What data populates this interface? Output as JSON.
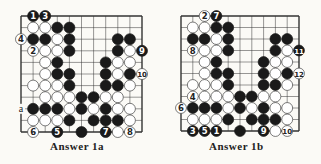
{
  "colors": {
    "black": "#1a1a1a",
    "white": "#ffffff",
    "line": "#333333",
    "paper": "#fbfaf6"
  },
  "boards": [
    {
      "caption": "Answer 1a",
      "origin": [
        21,
        16
      ],
      "step": [
        12.1,
        11.6
      ],
      "cols": 11,
      "rows": 11,
      "labels": [
        {
          "text": "a",
          "c": 0,
          "r": 8
        }
      ],
      "stones": [
        {
          "c": 1,
          "r": 0,
          "color": "B",
          "n": "1"
        },
        {
          "c": 2,
          "r": 0,
          "color": "B",
          "n": "3"
        },
        {
          "c": 1,
          "r": 1,
          "color": "W"
        },
        {
          "c": 2,
          "r": 1,
          "color": "W"
        },
        {
          "c": 3,
          "r": 1,
          "color": "B"
        },
        {
          "c": 4,
          "r": 1,
          "color": "B"
        },
        {
          "c": 0,
          "r": 2,
          "color": "W",
          "n": "4"
        },
        {
          "c": 1,
          "r": 2,
          "color": "B"
        },
        {
          "c": 2,
          "r": 2,
          "color": "B"
        },
        {
          "c": 3,
          "r": 2,
          "color": "W"
        },
        {
          "c": 4,
          "r": 2,
          "color": "B"
        },
        {
          "c": 8,
          "r": 2,
          "color": "B"
        },
        {
          "c": 9,
          "r": 2,
          "color": "B"
        },
        {
          "c": 1,
          "r": 3,
          "color": "W",
          "n": "2"
        },
        {
          "c": 2,
          "r": 3,
          "color": "W"
        },
        {
          "c": 3,
          "r": 3,
          "color": "W"
        },
        {
          "c": 4,
          "r": 3,
          "color": "B"
        },
        {
          "c": 8,
          "r": 3,
          "color": "B"
        },
        {
          "c": 9,
          "r": 3,
          "color": "W"
        },
        {
          "c": 10,
          "r": 3,
          "color": "B",
          "n": "9"
        },
        {
          "c": 2,
          "r": 4,
          "color": "W"
        },
        {
          "c": 3,
          "r": 4,
          "color": "B"
        },
        {
          "c": 7,
          "r": 4,
          "color": "B"
        },
        {
          "c": 8,
          "r": 4,
          "color": "W"
        },
        {
          "c": 9,
          "r": 4,
          "color": "W"
        },
        {
          "c": 2,
          "r": 5,
          "color": "W"
        },
        {
          "c": 3,
          "r": 5,
          "color": "B"
        },
        {
          "c": 4,
          "r": 5,
          "color": "B"
        },
        {
          "c": 7,
          "r": 5,
          "color": "B"
        },
        {
          "c": 8,
          "r": 5,
          "color": "W"
        },
        {
          "c": 9,
          "r": 5,
          "color": "B"
        },
        {
          "c": 10,
          "r": 5,
          "color": "W",
          "n": "10"
        },
        {
          "c": 1,
          "r": 6,
          "color": "W"
        },
        {
          "c": 2,
          "r": 6,
          "color": "W"
        },
        {
          "c": 3,
          "r": 6,
          "color": "W"
        },
        {
          "c": 4,
          "r": 6,
          "color": "B"
        },
        {
          "c": 7,
          "r": 6,
          "color": "B"
        },
        {
          "c": 8,
          "r": 6,
          "color": "B"
        },
        {
          "c": 9,
          "r": 6,
          "color": "W"
        },
        {
          "c": 2,
          "r": 7,
          "color": "W"
        },
        {
          "c": 3,
          "r": 7,
          "color": "W"
        },
        {
          "c": 4,
          "r": 7,
          "color": "W"
        },
        {
          "c": 5,
          "r": 7,
          "color": "B"
        },
        {
          "c": 6,
          "r": 7,
          "color": "B"
        },
        {
          "c": 7,
          "r": 7,
          "color": "W"
        },
        {
          "c": 8,
          "r": 7,
          "color": "W"
        },
        {
          "c": 1,
          "r": 8,
          "color": "B"
        },
        {
          "c": 2,
          "r": 8,
          "color": "B"
        },
        {
          "c": 3,
          "r": 8,
          "color": "B"
        },
        {
          "c": 4,
          "r": 8,
          "color": "W"
        },
        {
          "c": 5,
          "r": 8,
          "color": "B"
        },
        {
          "c": 6,
          "r": 8,
          "color": "W"
        },
        {
          "c": 7,
          "r": 8,
          "color": "B"
        },
        {
          "c": 8,
          "r": 8,
          "color": "W"
        },
        {
          "c": 9,
          "r": 8,
          "color": "W"
        },
        {
          "c": 1,
          "r": 9,
          "color": "W"
        },
        {
          "c": 2,
          "r": 9,
          "color": "W"
        },
        {
          "c": 3,
          "r": 9,
          "color": "W"
        },
        {
          "c": 4,
          "r": 9,
          "color": "B"
        },
        {
          "c": 6,
          "r": 9,
          "color": "B"
        },
        {
          "c": 7,
          "r": 9,
          "color": "B"
        },
        {
          "c": 8,
          "r": 9,
          "color": "B"
        },
        {
          "c": 9,
          "r": 9,
          "color": "W"
        },
        {
          "c": 1,
          "r": 10,
          "color": "W",
          "n": "6"
        },
        {
          "c": 3,
          "r": 10,
          "color": "B",
          "n": "5"
        },
        {
          "c": 5,
          "r": 10,
          "color": "B"
        },
        {
          "c": 7,
          "r": 10,
          "color": "B",
          "n": "7"
        },
        {
          "c": 8,
          "r": 10,
          "color": "W"
        },
        {
          "c": 9,
          "r": 10,
          "color": "W",
          "n": "8"
        }
      ]
    },
    {
      "caption": "Answer 1b",
      "origin": [
        181,
        16
      ],
      "step": [
        11.8,
        11.5
      ],
      "cols": 11,
      "rows": 11,
      "labels": [],
      "stones": [
        {
          "c": 2,
          "r": 0,
          "color": "W",
          "n": "2"
        },
        {
          "c": 3,
          "r": 0,
          "color": "B",
          "n": "7"
        },
        {
          "c": 1,
          "r": 1,
          "color": "W"
        },
        {
          "c": 2,
          "r": 1,
          "color": "W"
        },
        {
          "c": 3,
          "r": 1,
          "color": "B"
        },
        {
          "c": 4,
          "r": 1,
          "color": "B"
        },
        {
          "c": 1,
          "r": 2,
          "color": "B"
        },
        {
          "c": 2,
          "r": 2,
          "color": "B"
        },
        {
          "c": 3,
          "r": 2,
          "color": "W"
        },
        {
          "c": 4,
          "r": 2,
          "color": "B"
        },
        {
          "c": 8,
          "r": 2,
          "color": "B"
        },
        {
          "c": 9,
          "r": 2,
          "color": "B"
        },
        {
          "c": 1,
          "r": 3,
          "color": "W",
          "n": "8"
        },
        {
          "c": 2,
          "r": 3,
          "color": "W"
        },
        {
          "c": 3,
          "r": 3,
          "color": "W"
        },
        {
          "c": 4,
          "r": 3,
          "color": "B"
        },
        {
          "c": 8,
          "r": 3,
          "color": "B"
        },
        {
          "c": 9,
          "r": 3,
          "color": "W"
        },
        {
          "c": 10,
          "r": 3,
          "color": "B",
          "n": "11"
        },
        {
          "c": 2,
          "r": 4,
          "color": "W"
        },
        {
          "c": 3,
          "r": 4,
          "color": "B"
        },
        {
          "c": 7,
          "r": 4,
          "color": "B"
        },
        {
          "c": 8,
          "r": 4,
          "color": "W"
        },
        {
          "c": 9,
          "r": 4,
          "color": "W"
        },
        {
          "c": 2,
          "r": 5,
          "color": "W"
        },
        {
          "c": 3,
          "r": 5,
          "color": "B"
        },
        {
          "c": 4,
          "r": 5,
          "color": "B"
        },
        {
          "c": 7,
          "r": 5,
          "color": "B"
        },
        {
          "c": 8,
          "r": 5,
          "color": "W"
        },
        {
          "c": 9,
          "r": 5,
          "color": "B"
        },
        {
          "c": 10,
          "r": 5,
          "color": "W",
          "n": "12"
        },
        {
          "c": 1,
          "r": 6,
          "color": "W"
        },
        {
          "c": 2,
          "r": 6,
          "color": "W"
        },
        {
          "c": 3,
          "r": 6,
          "color": "W"
        },
        {
          "c": 4,
          "r": 6,
          "color": "B"
        },
        {
          "c": 7,
          "r": 6,
          "color": "B"
        },
        {
          "c": 8,
          "r": 6,
          "color": "B"
        },
        {
          "c": 9,
          "r": 6,
          "color": "W"
        },
        {
          "c": 1,
          "r": 7,
          "color": "W",
          "n": "4"
        },
        {
          "c": 2,
          "r": 7,
          "color": "W"
        },
        {
          "c": 3,
          "r": 7,
          "color": "W"
        },
        {
          "c": 4,
          "r": 7,
          "color": "W"
        },
        {
          "c": 5,
          "r": 7,
          "color": "B"
        },
        {
          "c": 6,
          "r": 7,
          "color": "B"
        },
        {
          "c": 7,
          "r": 7,
          "color": "W"
        },
        {
          "c": 8,
          "r": 7,
          "color": "W"
        },
        {
          "c": 0,
          "r": 8,
          "color": "W",
          "n": "6"
        },
        {
          "c": 1,
          "r": 8,
          "color": "B"
        },
        {
          "c": 2,
          "r": 8,
          "color": "B"
        },
        {
          "c": 3,
          "r": 8,
          "color": "B"
        },
        {
          "c": 4,
          "r": 8,
          "color": "W"
        },
        {
          "c": 5,
          "r": 8,
          "color": "B"
        },
        {
          "c": 6,
          "r": 8,
          "color": "W"
        },
        {
          "c": 7,
          "r": 8,
          "color": "B"
        },
        {
          "c": 8,
          "r": 8,
          "color": "W"
        },
        {
          "c": 9,
          "r": 8,
          "color": "W"
        },
        {
          "c": 1,
          "r": 9,
          "color": "W"
        },
        {
          "c": 2,
          "r": 9,
          "color": "W"
        },
        {
          "c": 3,
          "r": 9,
          "color": "W"
        },
        {
          "c": 4,
          "r": 9,
          "color": "B"
        },
        {
          "c": 6,
          "r": 9,
          "color": "B"
        },
        {
          "c": 7,
          "r": 9,
          "color": "B"
        },
        {
          "c": 8,
          "r": 9,
          "color": "B"
        },
        {
          "c": 9,
          "r": 9,
          "color": "W"
        },
        {
          "c": 1,
          "r": 10,
          "color": "B",
          "n": "3"
        },
        {
          "c": 2,
          "r": 10,
          "color": "B",
          "n": "5"
        },
        {
          "c": 3,
          "r": 10,
          "color": "B",
          "n": "1"
        },
        {
          "c": 5,
          "r": 10,
          "color": "B"
        },
        {
          "c": 7,
          "r": 10,
          "color": "B",
          "n": "9"
        },
        {
          "c": 8,
          "r": 10,
          "color": "W"
        },
        {
          "c": 9,
          "r": 10,
          "color": "W",
          "n": "10"
        }
      ]
    }
  ]
}
